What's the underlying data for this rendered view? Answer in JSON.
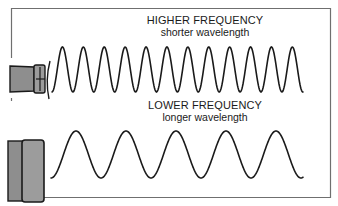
{
  "diagram": {
    "high": {
      "title": "HIGHER FREQUENCY",
      "subtitle": "shorter wavelength",
      "wave": {
        "start_x": 52,
        "end_x": 303,
        "center_y": 69.5,
        "amplitude": 22.5,
        "period": 20.9,
        "phase_start": "trough"
      }
    },
    "low": {
      "title": "LOWER FREQUENCY",
      "subtitle": "longer wavelength",
      "wave": {
        "start_x": 51,
        "end_x": 303,
        "center_y": 154.5,
        "amplitude": 23.5,
        "period": 50,
        "phase_start": "trough"
      }
    },
    "colors": {
      "line": "#1a1a1a",
      "frame": "#6f6f6f",
      "transducer_fill": "#8e8e8e",
      "transducer_cap": "#9c9c9c",
      "transducer_stroke": "#1a1a1a"
    }
  }
}
